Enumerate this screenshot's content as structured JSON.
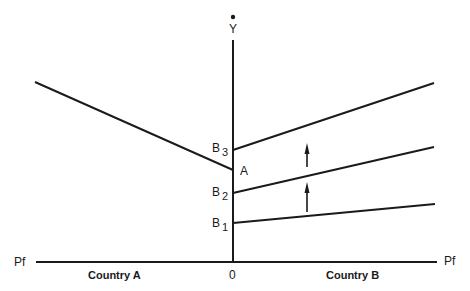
{
  "diagram": {
    "y_axis_label": "Y",
    "x_axis_label_left": "Pf",
    "x_axis_label_right": "Pf",
    "origin_label": "0",
    "country_a_label": "Country A",
    "country_b_label": "Country B",
    "points": {
      "A": "A",
      "B1": {
        "base": "B",
        "sub": "1"
      },
      "B2": {
        "base": "B",
        "sub": "2"
      },
      "B3": {
        "base": "B",
        "sub": "3"
      }
    },
    "line_color": "#1a1a1a"
  }
}
